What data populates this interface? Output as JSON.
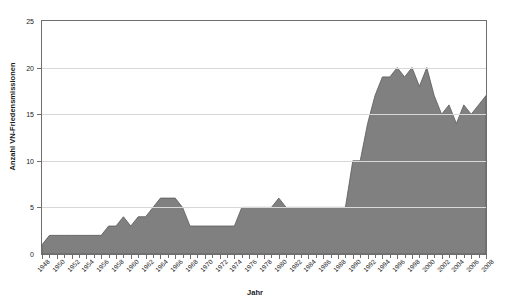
{
  "chart_data": {
    "type": "area",
    "title": "",
    "subtitle": "",
    "xlabel": "Jahr",
    "ylabel": "Anzahl VN-Friedensmissionen",
    "xlim": [
      1948,
      2008
    ],
    "ylim": [
      0,
      25
    ],
    "yticks": [
      0,
      5,
      10,
      15,
      20,
      25
    ],
    "xticks": [
      1948,
      1950,
      1952,
      1954,
      1956,
      1958,
      1960,
      1962,
      1964,
      1966,
      1968,
      1970,
      1972,
      1974,
      1976,
      1978,
      1980,
      1982,
      1984,
      1986,
      1988,
      1990,
      1992,
      1994,
      1996,
      1998,
      2000,
      2002,
      2004,
      2006,
      2008
    ],
    "grid": true,
    "grid_axis": "y",
    "legend": false,
    "legend_position": "none",
    "area_fill_color": "#808080",
    "area_line_color": "#5a5a5a",
    "grid_color": "#d8d8d8",
    "axis_color": "#6e6e6e",
    "plot_background": "#ffffff",
    "x": [
      1948,
      1949,
      1950,
      1951,
      1952,
      1953,
      1954,
      1955,
      1956,
      1957,
      1958,
      1959,
      1960,
      1961,
      1962,
      1963,
      1964,
      1965,
      1966,
      1967,
      1968,
      1969,
      1970,
      1971,
      1972,
      1973,
      1974,
      1975,
      1976,
      1977,
      1978,
      1979,
      1980,
      1981,
      1982,
      1983,
      1984,
      1985,
      1986,
      1987,
      1988,
      1989,
      1990,
      1991,
      1992,
      1993,
      1994,
      1995,
      1996,
      1997,
      1998,
      1999,
      2000,
      2001,
      2002,
      2003,
      2004,
      2005,
      2006,
      2007,
      2008
    ],
    "values": [
      1,
      2,
      2,
      2,
      2,
      2,
      2,
      2,
      2,
      3,
      3,
      4,
      3,
      4,
      4,
      5,
      6,
      6,
      6,
      5,
      3,
      3,
      3,
      3,
      3,
      3,
      3,
      5,
      5,
      5,
      5,
      5,
      6,
      5,
      5,
      5,
      5,
      5,
      5,
      5,
      5,
      5,
      10,
      10,
      14,
      17,
      19,
      19,
      20,
      19,
      20,
      18,
      20,
      17,
      15,
      16,
      14,
      16,
      15,
      16,
      17
    ],
    "series": [
      {
        "name": "Anzahl VN-Friedensmissionen",
        "values": [
          1,
          2,
          2,
          2,
          2,
          2,
          2,
          2,
          2,
          3,
          3,
          4,
          3,
          4,
          4,
          5,
          6,
          6,
          6,
          5,
          3,
          3,
          3,
          3,
          3,
          3,
          3,
          5,
          5,
          5,
          5,
          5,
          6,
          5,
          5,
          5,
          5,
          5,
          5,
          5,
          5,
          5,
          10,
          10,
          14,
          17,
          19,
          19,
          20,
          19,
          20,
          18,
          20,
          17,
          15,
          16,
          14,
          16,
          15,
          16,
          17
        ]
      }
    ]
  }
}
